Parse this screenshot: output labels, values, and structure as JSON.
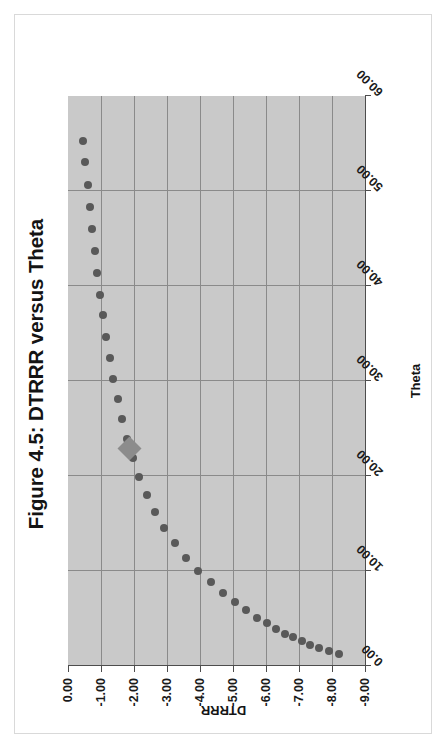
{
  "figure": {
    "title": "Figure 4.5: DTRRR versus Theta",
    "orientation": "rotated-90-ccw",
    "frame_color": "#d9d9d9",
    "plot_background": "#c9c9c9",
    "gridline_color": "#8a8a8a",
    "marker_color": "#595959",
    "highlight_marker_color": "#8c8c8c"
  },
  "axes": {
    "x": {
      "title": "Theta",
      "ticks": [
        "0.00",
        "10.00",
        "20.00",
        "30.00",
        "40.00",
        "50.00",
        "60.00"
      ],
      "min": 0,
      "max": 60,
      "step": 10
    },
    "y": {
      "title": "DTRRR",
      "ticks": [
        "0.00",
        "-1.00",
        "-2.00",
        "-3.00",
        "-4.00",
        "-5.00",
        "-6.00",
        "-7.00",
        "-8.00",
        "-9.00"
      ],
      "min": -9,
      "max": 0,
      "step": 1
    }
  },
  "chart_data": {
    "type": "scatter",
    "title": "Figure 4.5: DTRRR versus Theta",
    "xlabel": "Theta",
    "ylabel": "DTRRR",
    "xlim": [
      0,
      60
    ],
    "ylim": [
      -9,
      0
    ],
    "grid": true,
    "legend": "none",
    "series": [
      {
        "name": "DTRRR",
        "marker": "circle",
        "color": "#595959",
        "points": [
          [
            55.3,
            -0.45
          ],
          [
            53.0,
            -0.52
          ],
          [
            50.6,
            -0.6
          ],
          [
            48.3,
            -0.67
          ],
          [
            46.0,
            -0.74
          ],
          [
            43.7,
            -0.81
          ],
          [
            41.4,
            -0.89
          ],
          [
            39.1,
            -0.97
          ],
          [
            36.9,
            -1.06
          ],
          [
            34.6,
            -1.16
          ],
          [
            32.4,
            -1.26
          ],
          [
            30.2,
            -1.37
          ],
          [
            28.1,
            -1.5
          ],
          [
            26.0,
            -1.63
          ],
          [
            23.9,
            -1.79
          ],
          [
            21.9,
            -1.96
          ],
          [
            19.9,
            -2.16
          ],
          [
            18.0,
            -2.38
          ],
          [
            16.2,
            -2.63
          ],
          [
            14.5,
            -2.92
          ],
          [
            12.9,
            -3.24
          ],
          [
            11.4,
            -3.58
          ],
          [
            10.0,
            -3.94
          ],
          [
            8.8,
            -4.32
          ],
          [
            7.7,
            -4.7
          ],
          [
            6.7,
            -5.06
          ],
          [
            5.9,
            -5.4
          ],
          [
            5.1,
            -5.72
          ],
          [
            4.5,
            -6.02
          ],
          [
            3.9,
            -6.3
          ],
          [
            3.4,
            -6.57
          ],
          [
            3.0,
            -6.83
          ],
          [
            2.6,
            -7.08
          ],
          [
            2.2,
            -7.33
          ],
          [
            1.9,
            -7.6
          ],
          [
            1.6,
            -7.9
          ],
          [
            1.3,
            -8.2
          ]
        ]
      },
      {
        "name": "Operating point",
        "marker": "diamond",
        "color": "#8c8c8c",
        "points": [
          [
            22.9,
            -1.87
          ]
        ]
      }
    ]
  }
}
